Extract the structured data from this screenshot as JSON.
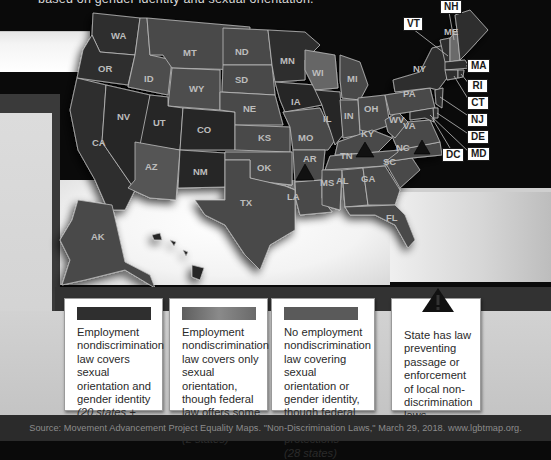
{
  "header": {
    "subtitle_fragment": "based on gender identity and sexual orientation."
  },
  "map": {
    "title": "Employment nondiscrimination laws by state",
    "colors": {
      "both": "#2f2f2f",
      "sexual_orientation_only": "#5c5c5c",
      "none": "#4a4a4a",
      "borders": "#bdbdbd",
      "labels": "#bdbdbd",
      "background": "#0a0a0a"
    },
    "states": [
      {
        "abbr": "WA",
        "category": "both"
      },
      {
        "abbr": "OR",
        "category": "both"
      },
      {
        "abbr": "CA",
        "category": "both"
      },
      {
        "abbr": "NV",
        "category": "both"
      },
      {
        "abbr": "ID",
        "category": "none"
      },
      {
        "abbr": "MT",
        "category": "none"
      },
      {
        "abbr": "WY",
        "category": "none"
      },
      {
        "abbr": "UT",
        "category": "both"
      },
      {
        "abbr": "CO",
        "category": "both"
      },
      {
        "abbr": "AZ",
        "category": "none"
      },
      {
        "abbr": "NM",
        "category": "both"
      },
      {
        "abbr": "ND",
        "category": "none"
      },
      {
        "abbr": "SD",
        "category": "none"
      },
      {
        "abbr": "NE",
        "category": "none"
      },
      {
        "abbr": "KS",
        "category": "none"
      },
      {
        "abbr": "OK",
        "category": "none"
      },
      {
        "abbr": "TX",
        "category": "none"
      },
      {
        "abbr": "MN",
        "category": "both"
      },
      {
        "abbr": "IA",
        "category": "both"
      },
      {
        "abbr": "MO",
        "category": "none"
      },
      {
        "abbr": "AR",
        "category": "none",
        "preemption": true
      },
      {
        "abbr": "LA",
        "category": "none"
      },
      {
        "abbr": "WI",
        "category": "sexual_orientation_only"
      },
      {
        "abbr": "IL",
        "category": "both"
      },
      {
        "abbr": "MI",
        "category": "none"
      },
      {
        "abbr": "IN",
        "category": "none"
      },
      {
        "abbr": "OH",
        "category": "none"
      },
      {
        "abbr": "KY",
        "category": "none"
      },
      {
        "abbr": "TN",
        "category": "none",
        "preemption": true
      },
      {
        "abbr": "MS",
        "category": "none"
      },
      {
        "abbr": "AL",
        "category": "none"
      },
      {
        "abbr": "GA",
        "category": "none"
      },
      {
        "abbr": "FL",
        "category": "none"
      },
      {
        "abbr": "SC",
        "category": "none"
      },
      {
        "abbr": "NC",
        "category": "none",
        "preemption": true
      },
      {
        "abbr": "VA",
        "category": "none"
      },
      {
        "abbr": "WV",
        "category": "none"
      },
      {
        "abbr": "PA",
        "category": "none"
      },
      {
        "abbr": "NY",
        "category": "both"
      },
      {
        "abbr": "VT",
        "category": "both"
      },
      {
        "abbr": "NH",
        "category": "sexual_orientation_only"
      },
      {
        "abbr": "ME",
        "category": "both"
      },
      {
        "abbr": "MA",
        "category": "both"
      },
      {
        "abbr": "RI",
        "category": "both"
      },
      {
        "abbr": "CT",
        "category": "both"
      },
      {
        "abbr": "NJ",
        "category": "both"
      },
      {
        "abbr": "DE",
        "category": "both"
      },
      {
        "abbr": "MD",
        "category": "both"
      },
      {
        "abbr": "DC",
        "category": "both"
      },
      {
        "abbr": "AK",
        "category": "none"
      },
      {
        "abbr": "HI",
        "category": "both"
      }
    ],
    "labels": {
      "WA": "WA",
      "OR": "OR",
      "CA": "CA",
      "NV": "NV",
      "ID": "ID",
      "MT": "MT",
      "WY": "WY",
      "UT": "UT",
      "CO": "CO",
      "AZ": "AZ",
      "NM": "NM",
      "ND": "ND",
      "SD": "SD",
      "NE": "NE",
      "KS": "KS",
      "OK": "OK",
      "TX": "TX",
      "MN": "MN",
      "IA": "IA",
      "MO": "MO",
      "AR": "AR",
      "LA": "LA",
      "WI": "WI",
      "IL": "IL",
      "MI": "MI",
      "IN": "IN",
      "OH": "OH",
      "KY": "KY",
      "TN": "TN",
      "MS": "MS",
      "AL": "AL",
      "GA": "GA",
      "FL": "FL",
      "SC": "SC",
      "NC": "NC",
      "VA": "VA",
      "WV": "WV",
      "PA": "PA",
      "NY": "NY",
      "ME": "ME",
      "AK": "AK"
    },
    "callouts": {
      "NH": "NH",
      "VT": "VT",
      "MA": "MA",
      "RI": "RI",
      "CT": "CT",
      "NJ": "NJ",
      "DE": "DE",
      "MD": "MD",
      "DC": "DC"
    }
  },
  "legend": [
    {
      "swatch_color": "#2f2f2f",
      "text": "Employment nondiscrimination law covers sexual orientation and gender identity",
      "note": "(20 states + DC)"
    },
    {
      "swatch_color": "#7a7a7a",
      "text": "Employment nondiscrimination law covers only sexual orientation, though federal law offers some protections",
      "note": "(2 states)"
    },
    {
      "swatch_color": "#5a5a5a",
      "text": "No employment nondiscrimination law covering sexual orientation or gender identity, though federal law offers some protections",
      "note": "(28 states)"
    },
    {
      "icon": "warning-triangle",
      "text": "State has law preventing passage or enforcement of local non-discrimination laws",
      "note": ""
    }
  ],
  "footer": {
    "source": "Source: Movement Advancement Project Equality Maps. \"Non-Discrimination Laws,\" March 29, 2018. www.lgbtmap.org."
  }
}
